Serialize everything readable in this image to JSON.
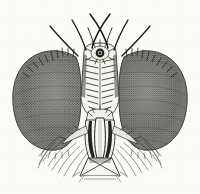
{
  "figure": {
    "medium": "stipple-and-line engraving",
    "background_color": "#fbfbfa",
    "ink_color": "#1c1c1a",
    "eye_fill_color": "#6a6a68",
    "eye_shadow_color": "#3c3c3a",
    "width": 200,
    "height": 194
  },
  "parts": {
    "left_eye": {
      "name": "left compound eye",
      "texture": "dense ommatidia stipple",
      "fill": "#6a6a68"
    },
    "right_eye": {
      "name": "right compound eye",
      "texture": "dense ommatidia stipple",
      "fill": "#6a6a68"
    },
    "ocellar_spot": {
      "name": "ocellus",
      "fill": "#17170f"
    },
    "frons": {
      "name": "frons with frontal bristle rows",
      "fill": "#f4f4f0"
    },
    "proboscis": {
      "name": "proboscis and labrum",
      "fill": "#f2f2ee"
    },
    "labellum": {
      "name": "labellum",
      "fill": "#f6f6f2"
    },
    "bristles": {
      "name": "ocellar and vertical bristles",
      "count_visible": 6
    },
    "beard": {
      "name": "genal beard setae"
    }
  },
  "labels": {
    "figure_label": "",
    "caption": ""
  }
}
